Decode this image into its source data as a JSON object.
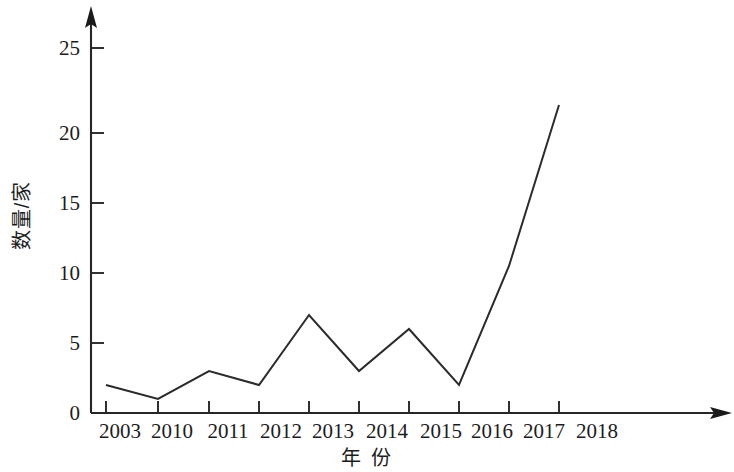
{
  "chart_data": {
    "type": "line",
    "title": "",
    "subtitle": "",
    "xlabel": "年 份",
    "ylabel": "数量/家",
    "categories": [
      "2003",
      "2010",
      "2011",
      "2012",
      "2013",
      "2014",
      "2015",
      "2016",
      "2017",
      "2018"
    ],
    "values": [
      2,
      1,
      3,
      2,
      7,
      3,
      6,
      2,
      10.5,
      22
    ],
    "series": [
      {
        "name": "数量/家",
        "values": [
          2,
          1,
          3,
          2,
          7,
          3,
          6,
          2,
          10.5,
          22
        ]
      }
    ],
    "ylim": [
      0,
      27
    ],
    "xlim": [
      0,
      10.5
    ],
    "y_ticks": [
      "0",
      "5",
      "10",
      "15",
      "20",
      "25"
    ],
    "y_tick_values": [
      0,
      5,
      10,
      15,
      20,
      25
    ],
    "grid": false,
    "legend": "none",
    "line_color": "#2b2b2b",
    "axis_color": "#262626",
    "background": "#ffffff",
    "markers": false,
    "x_axis_arrow": true,
    "y_axis_arrow": true
  },
  "axes": {
    "y_title": "数量/家",
    "x_title": "年 份"
  }
}
